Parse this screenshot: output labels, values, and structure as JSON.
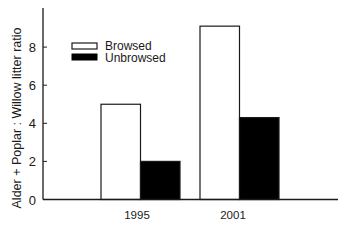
{
  "chart_data": {
    "type": "bar",
    "title": "",
    "xlabel": "",
    "ylabel": "Alder + Poplar : Willow litter ratio",
    "categories": [
      "1995",
      "2001"
    ],
    "series": [
      {
        "name": "Browsed",
        "color": "#ffffff",
        "values": [
          5.0,
          9.1
        ]
      },
      {
        "name": "Unbrowsed",
        "color": "#000000",
        "values": [
          2.0,
          4.3
        ]
      }
    ],
    "ylim": [
      0,
      10
    ],
    "yticks": [
      0,
      2,
      4,
      6,
      8
    ],
    "grid": false,
    "legend_position": "upper left"
  },
  "labels": {
    "ylabel": "Alder + Poplar : Willow litter ratio",
    "legend": [
      "Browsed",
      "Unbrowsed"
    ],
    "categories": [
      "1995",
      "2001"
    ],
    "yticks": [
      "0",
      "2",
      "4",
      "6",
      "8"
    ]
  }
}
